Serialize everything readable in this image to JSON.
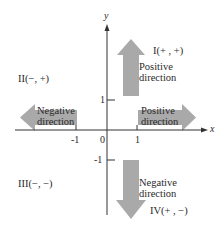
{
  "diagram": {
    "axes": {
      "x_label": "x",
      "y_label": "y",
      "origin_label": "0",
      "x_ticks": [
        "-1",
        "1"
      ],
      "y_ticks": [
        "1",
        "-1"
      ]
    },
    "quadrants": {
      "I": "I(+ ,  +)",
      "II": "II(−,  +)",
      "III": "III(−, −)",
      "IV": "IV(+ ,  −)"
    },
    "arrows": {
      "up": {
        "line1": "Positive",
        "line2": "direction"
      },
      "right": {
        "line1": "Positive",
        "line2": "direction"
      },
      "left": {
        "line1": "Negative",
        "line2": "direction"
      },
      "down": {
        "line1": "Negative",
        "line2": "direction"
      }
    },
    "colors": {
      "arrow_fill": "#a9a9a9",
      "axis": "#333333",
      "background": "#ffffff"
    }
  }
}
